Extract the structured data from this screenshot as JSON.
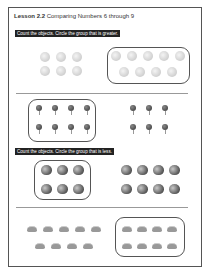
{
  "header": {
    "lesson_label": "Lesson 2.2",
    "lesson_title": "Comparing Numbers 6 through 9"
  },
  "sections": [
    {
      "instruction": "Count the objects. Circle the group that is greater.",
      "problems": [
        {
          "object": "ball-icon",
          "left_group": {
            "count": 6,
            "circled": false
          },
          "right_group": {
            "count": 9,
            "circled": true
          }
        },
        {
          "object": "pin-icon",
          "left_group": {
            "count": 8,
            "circled": true
          },
          "right_group": {
            "count": 6,
            "circled": false
          }
        }
      ]
    },
    {
      "instruction": "Count the objects. Circle the group that is less.",
      "problems": [
        {
          "object": "apple-icon",
          "left_group": {
            "count": 6,
            "circled": true
          },
          "right_group": {
            "count": 8,
            "circled": false
          }
        },
        {
          "object": "cloud-icon",
          "left_group": {
            "count": 9,
            "circled": false
          },
          "right_group": {
            "count": 8,
            "circled": true
          }
        }
      ]
    }
  ],
  "colors": {
    "banner_bg": "#222222",
    "banner_text": "#ffffff",
    "border": "#555555"
  }
}
